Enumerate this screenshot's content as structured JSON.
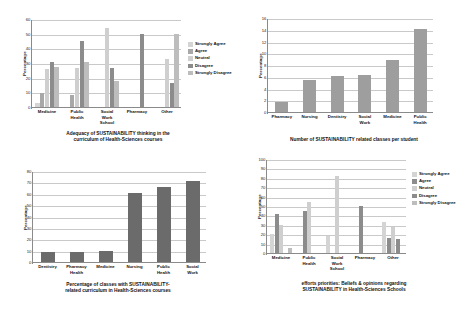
{
  "figure": {
    "panels": [
      "panel-1",
      "panel-2",
      "panel-3",
      "panel-4"
    ]
  },
  "chart_data": [
    {
      "id": "adequacy-of-sustainability-thinking",
      "type": "bar",
      "title": "Adequacy of SUSTAINABILITY thinking  in the\ncurriculum of Health-Sciences courses",
      "xlabel": "",
      "ylabel": "Percentage",
      "ylim": [
        0,
        60
      ],
      "yticks": [
        0,
        10,
        20,
        30,
        40,
        50,
        60
      ],
      "grid": true,
      "legend_position": "right",
      "categories": [
        "Medicine",
        "Public\nHealth",
        "Social\nWork\nSchool",
        "Pharmacy",
        "Other"
      ],
      "series": [
        {
          "name": "Strongly Agree",
          "color": "#d4d4d4",
          "values": [
            3,
            0,
            0,
            0,
            0
          ]
        },
        {
          "name": "Agree",
          "color": "#a8a8a8",
          "values": [
            9.5,
            8.5,
            0,
            0,
            0
          ]
        },
        {
          "name": "Neutral",
          "color": "#cfcfcf",
          "values": [
            26,
            26.5,
            54,
            0,
            33
          ]
        },
        {
          "name": "Disagree",
          "color": "#8c8c8c",
          "values": [
            31,
            45,
            26.5,
            50,
            16.5
          ]
        },
        {
          "name": "Strongly Disagree",
          "color": "#bdbdbd",
          "values": [
            27,
            31,
            18,
            0,
            50
          ]
        }
      ]
    },
    {
      "id": "number-of-sustainability-related-classes",
      "type": "bar",
      "title": "Number of SUSTAINABILITY related classes per student",
      "xlabel": "",
      "ylabel": "Percentage",
      "ylim": [
        0,
        16
      ],
      "yticks": [
        0,
        2,
        4,
        6,
        8,
        10,
        12,
        14,
        16
      ],
      "grid": true,
      "legend_position": "none",
      "categories": [
        "Pharmacy",
        "Nursing",
        "Dentistry",
        "Social\nWork",
        "Medicine",
        "Public\nHealth"
      ],
      "series": [
        {
          "name": "Classes per student",
          "color": "#9e9e9e",
          "values": [
            1.7,
            5.4,
            6.2,
            6.3,
            8.8,
            14.2
          ]
        }
      ]
    },
    {
      "id": "percentage-of-classes-with-sustainability-curriculum",
      "type": "bar",
      "title": "Percentage of classes with SUSTAINABILITY-\nrelated curriculum  in Health-Sciences courses",
      "xlabel": "",
      "ylabel": "Percentage",
      "ylim": [
        0,
        80
      ],
      "yticks": [
        0,
        10,
        20,
        30,
        40,
        50,
        60,
        70,
        80
      ],
      "grid": true,
      "legend_position": "none",
      "categories": [
        "Dentistry",
        "Pharmacy\nHealth",
        "Medicine",
        "Nursing",
        "Public\nHealth",
        "Social\nWork"
      ],
      "series": [
        {
          "name": "Percentage of classes",
          "color": "#6b6b6b",
          "values": [
            9,
            9,
            10,
            61,
            66,
            71
          ]
        }
      ]
    },
    {
      "id": "efforts-priorities-beliefs-and-opinions",
      "type": "bar",
      "title": "efforts priorities: Beliefs & opinions regarding\nSUSTAINABILITY in Health-Sciences Schools",
      "xlabel": "",
      "ylabel": "Percentage",
      "ylim": [
        0,
        100
      ],
      "yticks": [
        0,
        10,
        20,
        30,
        40,
        50,
        60,
        70,
        80,
        90,
        100
      ],
      "grid": true,
      "legend_position": "right",
      "categories": [
        "Medicine",
        "Public\nHealth",
        "Social\nWork\nSchool",
        "Pharmacy",
        "Other"
      ],
      "series": [
        {
          "name": "Strongly Agree",
          "color": "#d4d4d4",
          "values": [
            20,
            0,
            18,
            0,
            33
          ]
        },
        {
          "name": "Agree",
          "color": "#8c8c8c",
          "values": [
            41,
            45,
            0,
            50,
            16
          ]
        },
        {
          "name": "Neutral",
          "color": "#cfcfcf",
          "values": [
            30,
            54,
            82,
            0,
            28
          ]
        },
        {
          "name": "Disagree",
          "color": "#8c8c8c",
          "values": [
            0,
            0,
            0,
            0,
            15
          ]
        },
        {
          "name": "Strongly Disagree",
          "color": "#bdbdbd",
          "values": [
            5,
            0,
            0,
            0,
            0
          ]
        }
      ]
    }
  ]
}
